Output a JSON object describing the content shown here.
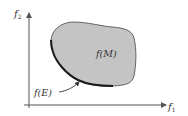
{
  "diagram": {
    "type": "objective-space",
    "axes": {
      "x_label_main": "f",
      "x_label_sub": "1",
      "y_label_main": "f",
      "y_label_sub": "2"
    },
    "region": {
      "label": "f(M)",
      "fill": "#c4c4c4",
      "stroke": "#555555"
    },
    "pareto_front": {
      "label": "f(E)",
      "stroke": "#1a1a1a"
    },
    "colors": {
      "axis": "#555555",
      "text": "#333333",
      "background": "#ffffff"
    }
  }
}
